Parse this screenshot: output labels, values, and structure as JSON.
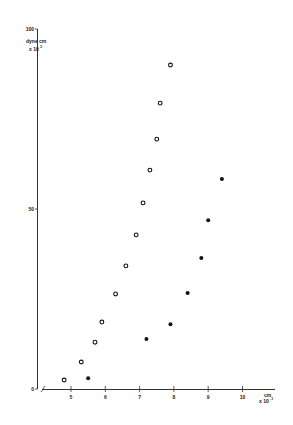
{
  "chart_data": {
    "type": "scatter",
    "title": "",
    "xlabel": "cm x 10^-1",
    "ylabel": "dyne cm x 10^3",
    "x_unit_line1": "cm",
    "x_unit_line2": "x 10",
    "x_unit_exp": "-1",
    "y_unit_line1": "dyne cm",
    "y_unit_line2": "x 10",
    "y_unit_exp": "3",
    "xlim": [
      4,
      10.9
    ],
    "ylim": [
      0,
      100
    ],
    "x_ticks": [
      "5",
      "6",
      "7",
      "8",
      "9",
      "10"
    ],
    "y_ticks": [
      "0",
      "50",
      "100"
    ],
    "grid": false,
    "legend": "none",
    "series": [
      {
        "name": "open circles",
        "marker": "open-circle",
        "points": [
          [
            4.8,
            2.5
          ],
          [
            5.3,
            7.5
          ],
          [
            5.7,
            13
          ],
          [
            5.9,
            18.6
          ],
          [
            6.3,
            26.4
          ],
          [
            6.6,
            34.2
          ],
          [
            6.9,
            42.8
          ],
          [
            7.1,
            51.7
          ],
          [
            7.3,
            60.8
          ],
          [
            7.5,
            69.4
          ],
          [
            7.6,
            79.4
          ],
          [
            7.9,
            90
          ]
        ]
      },
      {
        "name": "filled circles",
        "marker": "filled-circle",
        "points": [
          [
            5.5,
            3
          ],
          [
            7.2,
            13.9
          ],
          [
            7.9,
            18
          ],
          [
            8.4,
            26.7
          ],
          [
            8.8,
            36.4
          ],
          [
            9.0,
            46.9
          ],
          [
            9.4,
            58.3
          ]
        ]
      }
    ]
  }
}
